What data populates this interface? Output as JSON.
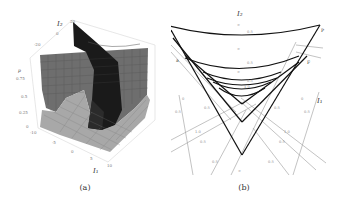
{
  "figure": {
    "panels": [
      {
        "id": "a",
        "caption": "(a)",
        "type": "3d-surface",
        "axes": {
          "vertical_label": "I₂",
          "depth_label": "p",
          "horizontal_label": "I₁",
          "vertical_ticks": [
            "20",
            "0",
            "-20"
          ],
          "p_ticks": [
            "1",
            "0.75",
            "0.5",
            "0.25",
            "0"
          ],
          "horizontal_ticks": [
            "-10",
            "-5",
            "0",
            "5",
            "10"
          ]
        }
      },
      {
        "id": "b",
        "caption": "(b)",
        "type": "contour-diagram",
        "axes": {
          "top_label": "I₂",
          "right_label": "I₁"
        },
        "points": {
          "left": "a",
          "right_top": "P",
          "right": "F"
        },
        "contour_labels": {
          "top_center": [
            "∞",
            "0.5",
            "∞",
            "0.5",
            "∞",
            "0.5",
            "1.0"
          ],
          "left": [
            "0",
            "0.5",
            "0.5",
            "1.0",
            "0.5",
            "0.5"
          ],
          "right": [
            "0",
            "0.5",
            "0.5",
            "1.0",
            "0.5",
            "0.5"
          ],
          "bottom": [
            "∞"
          ]
        }
      }
    ]
  }
}
